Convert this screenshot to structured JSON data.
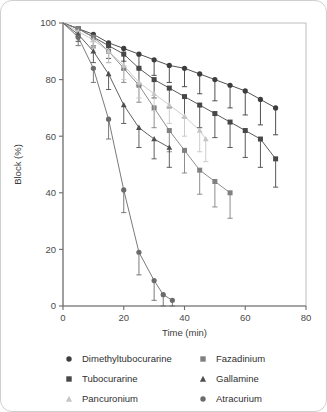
{
  "chart_data": {
    "type": "line",
    "title": "",
    "xlabel": "Time (min)",
    "ylabel": "Block (%)",
    "xlim": [
      0,
      80
    ],
    "ylim": [
      0,
      100
    ],
    "xticks": [
      0,
      20,
      40,
      60,
      80
    ],
    "yticks": [
      0,
      20,
      40,
      60,
      80,
      100
    ],
    "grid": false,
    "legend_position": "bottom",
    "errorbars": "one-sided-upper",
    "series": [
      {
        "name": "Dimethyltubocurarine",
        "marker": "circle",
        "color": "#3d3d3d",
        "x": [
          0,
          5,
          10,
          15,
          20,
          25,
          30,
          35,
          40,
          45,
          50,
          55,
          60,
          65,
          70
        ],
        "y": [
          100,
          98,
          96,
          93,
          91,
          89,
          87,
          85,
          84,
          82,
          80,
          78,
          76,
          73,
          70
        ],
        "err": [
          0,
          1.5,
          2.5,
          3.5,
          4.5,
          5,
          5.5,
          6,
          6.5,
          7,
          7.5,
          8,
          8.5,
          9,
          9.5
        ]
      },
      {
        "name": "Tubocurarine",
        "marker": "square",
        "color": "#474747",
        "x": [
          0,
          5,
          10,
          15,
          20,
          25,
          30,
          35,
          40,
          45,
          50,
          55,
          60,
          65,
          70
        ],
        "y": [
          100,
          98,
          95,
          92,
          89,
          84,
          80,
          77,
          74,
          71,
          68,
          65,
          62,
          59,
          52
        ],
        "err": [
          0,
          2,
          3.5,
          4.5,
          5.5,
          6,
          6.5,
          7,
          7.5,
          8,
          8.5,
          9,
          9.5,
          10,
          10
        ]
      },
      {
        "name": "Fazadinium",
        "marker": "square",
        "color": "#808080",
        "x": [
          0,
          5,
          10,
          15,
          20,
          25,
          30,
          35,
          40,
          45,
          50,
          55
        ],
        "y": [
          100,
          98,
          95,
          90,
          84,
          78,
          70,
          62,
          55,
          48,
          44,
          40
        ],
        "err": [
          0,
          2,
          3,
          4,
          5,
          6,
          7,
          7.5,
          8,
          8.5,
          9,
          9
        ]
      },
      {
        "name": "Pancuronium",
        "marker": "triangle",
        "color": "#c6c6c6",
        "x": [
          0,
          5,
          10,
          15,
          20,
          25,
          30,
          35,
          40,
          45,
          47
        ],
        "y": [
          100,
          97,
          94,
          90,
          85,
          79,
          75,
          71,
          67,
          62,
          59
        ],
        "err": [
          0,
          2,
          3,
          4,
          5,
          5.5,
          6,
          6.5,
          7,
          7.5,
          8
        ]
      },
      {
        "name": "Gallamine",
        "marker": "triangle",
        "color": "#4f4f4f",
        "x": [
          0,
          5,
          10,
          15,
          20,
          25,
          30,
          35
        ],
        "y": [
          100,
          96,
          90,
          82,
          71,
          63,
          59,
          56
        ],
        "err": [
          0,
          2.5,
          4,
          5.5,
          6.5,
          7,
          7,
          7
        ]
      },
      {
        "name": "Atracurium",
        "marker": "circle",
        "color": "#6b6b6b",
        "x": [
          0,
          5,
          10,
          15,
          20,
          25,
          30,
          33,
          36
        ],
        "y": [
          100,
          95,
          84,
          66,
          41,
          19,
          9,
          4,
          2
        ],
        "err": [
          0,
          3,
          5,
          7,
          8,
          8,
          7,
          6,
          5
        ]
      }
    ]
  },
  "legend": {
    "left_column": [
      {
        "label": "Dimethyltubocurarine",
        "marker": "circle",
        "color": "#3d3d3d"
      },
      {
        "label": "Tubocurarine",
        "marker": "square",
        "color": "#474747"
      },
      {
        "label": "Pancuronium",
        "marker": "triangle",
        "color": "#c6c6c6"
      }
    ],
    "right_column": [
      {
        "label": "Fazadinium",
        "marker": "square",
        "color": "#808080"
      },
      {
        "label": "Gallamine",
        "marker": "triangle",
        "color": "#4f4f4f"
      },
      {
        "label": "Atracurium",
        "marker": "circle",
        "color": "#6b6b6b"
      }
    ]
  }
}
